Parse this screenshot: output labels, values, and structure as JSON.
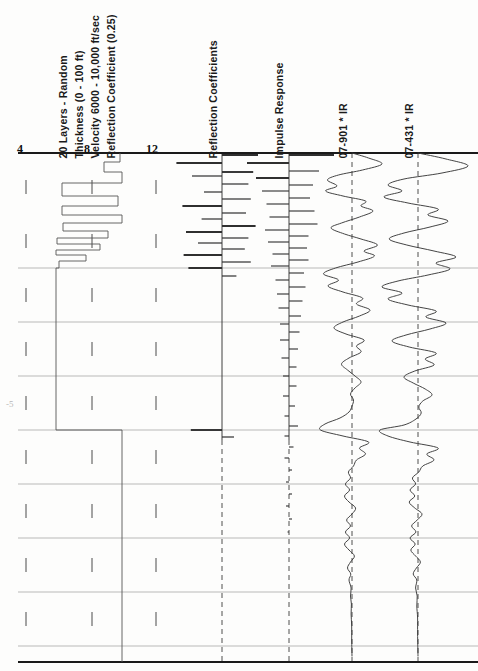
{
  "figure": {
    "title_block": [
      "20 Layers - Random",
      "Thickness  (0 - 100 ft)",
      "Velocity 6000 - 10,000 ft/sec",
      "Reflection Coefficient  (0.25)"
    ],
    "column_labels": [
      "Reflection Coefficients",
      "Impulse Response",
      "07-901 * IR",
      "07-431 * IR"
    ],
    "axis_numbers": [
      "4",
      "8",
      "12"
    ],
    "faint_margin_note": "-5",
    "colors": {
      "ink": "#1a1a1a",
      "trace": "#3a3a3a",
      "grid": "#8d8d8d",
      "paper": "#fdfdfc"
    }
  },
  "chart_data": {
    "type": "line",
    "xlabel": "Velocity (1000 ft/sec)",
    "ylabel": "Time (depth increasing downward)",
    "xlim": [
      2,
      14
    ],
    "grid": true,
    "legend": "none",
    "xtick_labels": [
      "4",
      "8",
      "12"
    ],
    "xtick_positions": [
      22,
      88,
      152
    ],
    "panel_axes_x": [
      222,
      289,
      352,
      418
    ],
    "top_rule_y": 153,
    "bottom_rule_y": 662,
    "gridline_y": [
      153,
      268,
      322,
      376,
      430,
      484,
      538,
      592,
      646
    ],
    "tick_y": [
      187,
      241,
      295,
      349,
      403,
      457,
      511,
      565,
      619
    ],
    "velocity_log": {
      "name": "Velocity log (blocky layers)",
      "units": "1000 ft/sec",
      "layers": [
        {
          "top": 153,
          "bottom": 162,
          "x": 120
        },
        {
          "top": 162,
          "bottom": 172,
          "x": 104
        },
        {
          "top": 172,
          "bottom": 183,
          "x": 122
        },
        {
          "top": 183,
          "bottom": 196,
          "x": 62
        },
        {
          "top": 196,
          "bottom": 206,
          "x": 118
        },
        {
          "top": 206,
          "bottom": 215,
          "x": 62
        },
        {
          "top": 215,
          "bottom": 223,
          "x": 122
        },
        {
          "top": 223,
          "bottom": 231,
          "x": 63
        },
        {
          "top": 231,
          "bottom": 238,
          "x": 108
        },
        {
          "top": 238,
          "bottom": 244,
          "x": 57
        },
        {
          "top": 244,
          "bottom": 250,
          "x": 100
        },
        {
          "top": 250,
          "bottom": 255,
          "x": 56
        },
        {
          "top": 255,
          "bottom": 261,
          "x": 86
        },
        {
          "top": 261,
          "bottom": 268,
          "x": 59
        },
        {
          "top": 268,
          "bottom": 430,
          "x": 56
        },
        {
          "top": 430,
          "bottom": 444,
          "x": 122
        },
        {
          "top": 444,
          "bottom": 662,
          "x": 122
        }
      ]
    },
    "reflection_coefficients": {
      "name": "Reflection Coefficients",
      "axis_x": 222,
      "scale_px_per_unit": 120,
      "spikes": [
        {
          "y": 155,
          "value": 0.3
        },
        {
          "y": 163,
          "value": -0.38
        },
        {
          "y": 172,
          "value": 0.26
        },
        {
          "y": 176,
          "value": -0.25
        },
        {
          "y": 184,
          "value": 0.22
        },
        {
          "y": 192,
          "value": -0.15
        },
        {
          "y": 199,
          "value": 0.24
        },
        {
          "y": 206,
          "value": -0.33
        },
        {
          "y": 213,
          "value": 0.2
        },
        {
          "y": 219,
          "value": -0.17
        },
        {
          "y": 226,
          "value": 0.28
        },
        {
          "y": 232,
          "value": -0.3
        },
        {
          "y": 238,
          "value": 0.22
        },
        {
          "y": 243,
          "value": -0.2
        },
        {
          "y": 249,
          "value": 0.19
        },
        {
          "y": 255,
          "value": -0.32
        },
        {
          "y": 262,
          "value": 0.24
        },
        {
          "y": 268,
          "value": -0.28
        },
        {
          "y": 276,
          "value": 0.12
        },
        {
          "y": 430,
          "value": -0.26
        },
        {
          "y": 437,
          "value": 0.1
        }
      ]
    },
    "impulse_response": {
      "name": "Impulse Response",
      "axis_x": 289,
      "description": "dense reverberatory spike train, amplitude decaying with time",
      "spikes": [
        {
          "y": 155,
          "value": 0.3
        },
        {
          "y": 163,
          "value": -0.28
        },
        {
          "y": 171,
          "value": 0.2
        },
        {
          "y": 178,
          "value": -0.22
        },
        {
          "y": 185,
          "value": 0.16
        },
        {
          "y": 191,
          "value": -0.18
        },
        {
          "y": 198,
          "value": 0.14
        },
        {
          "y": 204,
          "value": -0.15
        },
        {
          "y": 211,
          "value": 0.17
        },
        {
          "y": 217,
          "value": -0.13
        },
        {
          "y": 224,
          "value": 0.19
        },
        {
          "y": 230,
          "value": -0.16
        },
        {
          "y": 236,
          "value": 0.13
        },
        {
          "y": 242,
          "value": -0.14
        },
        {
          "y": 248,
          "value": 0.12
        },
        {
          "y": 254,
          "value": -0.11
        },
        {
          "y": 260,
          "value": 0.13
        },
        {
          "y": 266,
          "value": -0.12
        },
        {
          "y": 273,
          "value": 0.1
        },
        {
          "y": 280,
          "value": -0.09
        },
        {
          "y": 287,
          "value": 0.11
        },
        {
          "y": 294,
          "value": -0.08
        },
        {
          "y": 301,
          "value": 0.09
        },
        {
          "y": 308,
          "value": -0.07
        },
        {
          "y": 316,
          "value": 0.08
        },
        {
          "y": 324,
          "value": -0.06
        },
        {
          "y": 332,
          "value": 0.07
        },
        {
          "y": 340,
          "value": -0.06
        },
        {
          "y": 349,
          "value": 0.06
        },
        {
          "y": 358,
          "value": -0.05
        },
        {
          "y": 367,
          "value": 0.05
        },
        {
          "y": 376,
          "value": -0.04
        },
        {
          "y": 386,
          "value": 0.05
        },
        {
          "y": 396,
          "value": -0.04
        },
        {
          "y": 406,
          "value": 0.04
        },
        {
          "y": 416,
          "value": -0.03
        },
        {
          "y": 426,
          "value": 0.06
        },
        {
          "y": 436,
          "value": -0.03
        },
        {
          "y": 447,
          "value": 0.03
        },
        {
          "y": 458,
          "value": -0.03
        },
        {
          "y": 470,
          "value": 0.02
        },
        {
          "y": 482,
          "value": -0.02
        },
        {
          "y": 494,
          "value": 0.02
        },
        {
          "y": 506,
          "value": -0.02
        },
        {
          "y": 519,
          "value": 0.02
        },
        {
          "y": 532,
          "value": -0.01
        }
      ]
    },
    "traces": [
      {
        "name": "07-901 * IR",
        "axis_x": 352,
        "gain_px": 30,
        "samples": [
          {
            "y": 153,
            "a": 0.0
          },
          {
            "y": 158,
            "a": 0.55
          },
          {
            "y": 164,
            "a": 1.0
          },
          {
            "y": 170,
            "a": 0.35
          },
          {
            "y": 175,
            "a": -0.45
          },
          {
            "y": 180,
            "a": -0.82
          },
          {
            "y": 186,
            "a": -0.5
          },
          {
            "y": 191,
            "a": -0.88
          },
          {
            "y": 196,
            "a": -0.3
          },
          {
            "y": 201,
            "a": 0.45
          },
          {
            "y": 206,
            "a": 0.3
          },
          {
            "y": 211,
            "a": 0.7
          },
          {
            "y": 217,
            "a": 0.25
          },
          {
            "y": 223,
            "a": -0.35
          },
          {
            "y": 228,
            "a": -0.7
          },
          {
            "y": 234,
            "a": -0.25
          },
          {
            "y": 239,
            "a": 0.3
          },
          {
            "y": 245,
            "a": 0.85
          },
          {
            "y": 251,
            "a": 0.4
          },
          {
            "y": 256,
            "a": 0.75
          },
          {
            "y": 262,
            "a": 0.2
          },
          {
            "y": 268,
            "a": -0.55
          },
          {
            "y": 274,
            "a": -0.95
          },
          {
            "y": 280,
            "a": -0.45
          },
          {
            "y": 286,
            "a": -0.8
          },
          {
            "y": 292,
            "a": -0.3
          },
          {
            "y": 298,
            "a": 0.35
          },
          {
            "y": 304,
            "a": 0.15
          },
          {
            "y": 310,
            "a": 0.6
          },
          {
            "y": 316,
            "a": 0.25
          },
          {
            "y": 322,
            "a": -0.3
          },
          {
            "y": 328,
            "a": -0.6
          },
          {
            "y": 334,
            "a": -0.2
          },
          {
            "y": 340,
            "a": 0.4
          },
          {
            "y": 346,
            "a": 0.15
          },
          {
            "y": 352,
            "a": 0.3
          },
          {
            "y": 358,
            "a": -0.1
          },
          {
            "y": 364,
            "a": -0.35
          },
          {
            "y": 370,
            "a": -0.15
          },
          {
            "y": 376,
            "a": 0.1
          },
          {
            "y": 382,
            "a": 0.3
          },
          {
            "y": 388,
            "a": 0.1
          },
          {
            "y": 394,
            "a": -0.05
          },
          {
            "y": 400,
            "a": 0.05
          },
          {
            "y": 406,
            "a": 0.0
          },
          {
            "y": 412,
            "a": -0.1
          },
          {
            "y": 418,
            "a": -0.4
          },
          {
            "y": 424,
            "a": -0.9
          },
          {
            "y": 430,
            "a": -1.05
          },
          {
            "y": 436,
            "a": -0.3
          },
          {
            "y": 442,
            "a": 0.55
          },
          {
            "y": 448,
            "a": 0.25
          },
          {
            "y": 454,
            "a": 0.45
          },
          {
            "y": 460,
            "a": 0.15
          },
          {
            "y": 466,
            "a": 0.05
          },
          {
            "y": 472,
            "a": -0.12
          },
          {
            "y": 478,
            "a": -0.05
          },
          {
            "y": 484,
            "a": -0.22
          },
          {
            "y": 490,
            "a": -0.08
          },
          {
            "y": 496,
            "a": -0.25
          },
          {
            "y": 502,
            "a": -0.1
          },
          {
            "y": 508,
            "a": 0.12
          },
          {
            "y": 514,
            "a": 0.0
          },
          {
            "y": 520,
            "a": -0.18
          },
          {
            "y": 526,
            "a": -0.05
          },
          {
            "y": 532,
            "a": -0.22
          },
          {
            "y": 538,
            "a": -0.08
          },
          {
            "y": 544,
            "a": -0.25
          },
          {
            "y": 550,
            "a": -0.1
          },
          {
            "y": 556,
            "a": 0.08
          },
          {
            "y": 562,
            "a": -0.05
          },
          {
            "y": 568,
            "a": -0.15
          },
          {
            "y": 574,
            "a": -0.04
          },
          {
            "y": 580,
            "a": -0.1
          },
          {
            "y": 588,
            "a": -0.03
          },
          {
            "y": 596,
            "a": -0.05
          },
          {
            "y": 604,
            "a": -0.02
          },
          {
            "y": 614,
            "a": -0.03
          },
          {
            "y": 626,
            "a": -0.01
          },
          {
            "y": 640,
            "a": -0.01
          },
          {
            "y": 656,
            "a": 0.0
          }
        ]
      },
      {
        "name": "07-431 * IR",
        "axis_x": 418,
        "gain_px": 40,
        "samples": [
          {
            "y": 153,
            "a": 0.0
          },
          {
            "y": 159,
            "a": 0.7
          },
          {
            "y": 166,
            "a": 1.25
          },
          {
            "y": 173,
            "a": 0.6
          },
          {
            "y": 179,
            "a": -0.35
          },
          {
            "y": 185,
            "a": -0.75
          },
          {
            "y": 191,
            "a": -0.4
          },
          {
            "y": 197,
            "a": -0.85
          },
          {
            "y": 203,
            "a": -0.25
          },
          {
            "y": 209,
            "a": 0.5
          },
          {
            "y": 215,
            "a": 0.25
          },
          {
            "y": 221,
            "a": 0.75
          },
          {
            "y": 227,
            "a": 0.3
          },
          {
            "y": 233,
            "a": -0.35
          },
          {
            "y": 239,
            "a": -0.72
          },
          {
            "y": 245,
            "a": -0.28
          },
          {
            "y": 251,
            "a": 0.4
          },
          {
            "y": 257,
            "a": 0.95
          },
          {
            "y": 263,
            "a": 0.45
          },
          {
            "y": 269,
            "a": 0.8
          },
          {
            "y": 275,
            "a": 0.25
          },
          {
            "y": 281,
            "a": -0.5
          },
          {
            "y": 287,
            "a": -0.9
          },
          {
            "y": 293,
            "a": -0.4
          },
          {
            "y": 299,
            "a": -0.75
          },
          {
            "y": 305,
            "a": -0.25
          },
          {
            "y": 311,
            "a": 0.45
          },
          {
            "y": 317,
            "a": 0.2
          },
          {
            "y": 323,
            "a": 0.7
          },
          {
            "y": 329,
            "a": 0.3
          },
          {
            "y": 335,
            "a": -0.3
          },
          {
            "y": 341,
            "a": -0.65
          },
          {
            "y": 347,
            "a": -0.22
          },
          {
            "y": 353,
            "a": 0.45
          },
          {
            "y": 359,
            "a": 0.18
          },
          {
            "y": 365,
            "a": 0.4
          },
          {
            "y": 371,
            "a": -0.08
          },
          {
            "y": 377,
            "a": -0.35
          },
          {
            "y": 383,
            "a": -0.12
          },
          {
            "y": 389,
            "a": 0.18
          },
          {
            "y": 395,
            "a": 0.35
          },
          {
            "y": 401,
            "a": 0.12
          },
          {
            "y": 407,
            "a": 0.02
          },
          {
            "y": 413,
            "a": 0.08
          },
          {
            "y": 419,
            "a": -0.05
          },
          {
            "y": 425,
            "a": -0.35
          },
          {
            "y": 430,
            "a": -0.95
          },
          {
            "y": 436,
            "a": -0.75
          },
          {
            "y": 442,
            "a": -0.2
          },
          {
            "y": 448,
            "a": 0.5
          },
          {
            "y": 454,
            "a": 0.22
          },
          {
            "y": 460,
            "a": 0.4
          },
          {
            "y": 466,
            "a": 0.12
          },
          {
            "y": 472,
            "a": 0.02
          },
          {
            "y": 478,
            "a": -0.14
          },
          {
            "y": 484,
            "a": -0.06
          },
          {
            "y": 490,
            "a": -0.2
          },
          {
            "y": 496,
            "a": -0.08
          },
          {
            "y": 502,
            "a": -0.22
          },
          {
            "y": 508,
            "a": -0.08
          },
          {
            "y": 514,
            "a": 0.1
          },
          {
            "y": 520,
            "a": -0.02
          },
          {
            "y": 526,
            "a": -0.16
          },
          {
            "y": 532,
            "a": -0.05
          },
          {
            "y": 538,
            "a": -0.2
          },
          {
            "y": 544,
            "a": -0.07
          },
          {
            "y": 550,
            "a": -0.18
          },
          {
            "y": 556,
            "a": -0.06
          },
          {
            "y": 562,
            "a": 0.06
          },
          {
            "y": 568,
            "a": -0.04
          },
          {
            "y": 574,
            "a": -0.12
          },
          {
            "y": 580,
            "a": -0.03
          },
          {
            "y": 588,
            "a": -0.06
          },
          {
            "y": 596,
            "a": -0.02
          },
          {
            "y": 606,
            "a": -0.03
          },
          {
            "y": 618,
            "a": -0.01
          },
          {
            "y": 634,
            "a": -0.01
          },
          {
            "y": 656,
            "a": 0.0
          }
        ]
      }
    ]
  }
}
